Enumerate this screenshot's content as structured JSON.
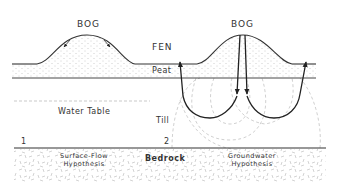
{
  "figure": {
    "labels": {
      "bog_left": "BOG",
      "bog_right": "BOG",
      "fen": "FEN",
      "peat": "Peat",
      "water_table": "Water Table",
      "till": "Till",
      "bedrock": "Bedrock",
      "marker_1": "1",
      "marker_2": "2",
      "hypothesis_1_line1": "Surface-Flow",
      "hypothesis_1_line2": "Hypothesis",
      "hypothesis_2_line1": "Groundwater",
      "hypothesis_2_line2": "Hypothesis"
    },
    "colors": {
      "line": "#333333",
      "dashed": "#bbbbbb",
      "stipple": "#999999",
      "background": "#ffffff"
    }
  }
}
